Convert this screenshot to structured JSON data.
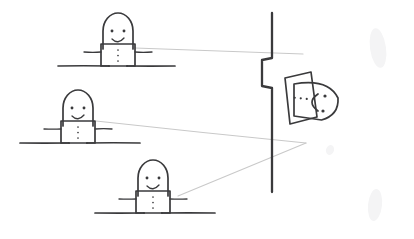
{
  "scene": {
    "title": "Hand-drawn sketch: three observers viewing a figure behind a wall",
    "medium": "pencil line drawing on white paper",
    "canvas": {
      "width": 414,
      "height": 239
    },
    "ink_color": "#3a3a3c",
    "sightline_color": "#c9c9c9",
    "background_color": "#ffffff",
    "smudge_color": "#f4f4f5"
  },
  "observers": [
    {
      "id": "observer-top",
      "label": "top-left smiling figure",
      "head": {
        "cx": 118,
        "cy": 33,
        "rx": 15,
        "ry": 18
      },
      "face": {
        "eyes": [
          [
            112,
            31
          ],
          [
            124,
            31
          ]
        ],
        "mouth_type": "smile-arc"
      },
      "body": {
        "x": 101,
        "y": 44,
        "width": 34,
        "height": 22
      },
      "torso_dots": 3,
      "arms": {
        "left_end": [
          84,
          52
        ],
        "right_end": [
          152,
          52
        ]
      },
      "legs": {
        "left_x": 109,
        "right_x": 127,
        "foot_y": 66
      },
      "ground": {
        "x1": 58,
        "x2": 175,
        "y": 66
      }
    },
    {
      "id": "observer-middle",
      "label": "middle-left smiling figure",
      "head": {
        "cx": 78,
        "cy": 110,
        "rx": 15,
        "ry": 18
      },
      "face": {
        "eyes": [
          [
            72,
            108
          ],
          [
            84,
            108
          ]
        ],
        "mouth_type": "smile-arc"
      },
      "body": {
        "x": 61,
        "y": 121,
        "width": 34,
        "height": 22
      },
      "torso_dots": 3,
      "arms": {
        "left_end": [
          44,
          129
        ],
        "right_end": [
          112,
          129
        ]
      },
      "legs": {
        "left_x": 69,
        "right_x": 87,
        "foot_y": 143
      },
      "ground": {
        "x1": 20,
        "x2": 140,
        "y": 143
      }
    },
    {
      "id": "observer-bottom",
      "label": "bottom-centre smiling figure",
      "head": {
        "cx": 153,
        "cy": 180,
        "rx": 15,
        "ry": 18
      },
      "face": {
        "eyes": [
          [
            147,
            178
          ],
          [
            159,
            178
          ]
        ],
        "mouth_type": "smile-arc"
      },
      "body": {
        "x": 136,
        "y": 191,
        "width": 34,
        "height": 22
      },
      "torso_dots": 3,
      "arms": {
        "left_end": [
          119,
          199
        ],
        "right_end": [
          187,
          199
        ]
      },
      "legs": {
        "left_x": 144,
        "right_x": 162,
        "foot_y": 213
      },
      "ground": {
        "x1": 95,
        "x2": 215,
        "y": 213
      }
    }
  ],
  "wall": {
    "id": "wall-with-notch",
    "label": "vertical wall with a step/notch the figure leans through",
    "top_y": 13,
    "bottom_y": 192,
    "x": 272,
    "notch_top_y": 58,
    "notch_bottom_y": 96,
    "notch_depth": 10
  },
  "subject": {
    "id": "subject-behind-wall",
    "label": "figure leaning out from behind the wall, head in profile facing right",
    "head": {
      "cx": 316,
      "cy": 100,
      "rx": 22,
      "ry": 20
    },
    "face": {
      "eyes": [
        [
          325,
          96
        ],
        [
          323,
          111
        ]
      ],
      "mouth_type": "C-shaped-mouth",
      "mouth_center": [
        312,
        102
      ]
    },
    "body_panel": {
      "label": "tilted rectangular torso panel",
      "points": "285,78 311,72 317,117 290,124",
      "dots": 3,
      "dots_y": 98
    },
    "limbs": {
      "upper_arm": "295,72 304,54 283,48",
      "lower_arm": "297,122 307,142 283,150"
    }
  },
  "sightlines": [
    {
      "id": "sightline-top",
      "label": "sight line from top figure to subject",
      "from": [
        135,
        48
      ],
      "to": [
        303,
        54
      ]
    },
    {
      "id": "sightline-middle",
      "label": "sight line from middle figure to subject",
      "from": [
        96,
        121
      ],
      "to": [
        306,
        143
      ]
    },
    {
      "id": "sightline-bottom",
      "label": "sight line from bottom figure to subject",
      "from": [
        178,
        196
      ],
      "to": [
        306,
        143
      ]
    }
  ],
  "smudges": [
    {
      "id": "smudge-top-right",
      "cx": 378,
      "cy": 48,
      "rx": 8,
      "ry": 20
    },
    {
      "id": "smudge-bottom-right",
      "cx": 375,
      "cy": 205,
      "rx": 7,
      "ry": 16
    },
    {
      "id": "smudge-mid-right",
      "cx": 330,
      "cy": 150,
      "rx": 4,
      "ry": 5
    }
  ]
}
